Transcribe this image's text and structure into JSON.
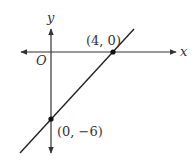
{
  "diagram": {
    "type": "coordinate-plane-line",
    "axes": {
      "x_label": "x",
      "y_label": "y",
      "origin_label": "O"
    },
    "points": [
      {
        "label": "(4, 0)",
        "x": 4,
        "y": 0
      },
      {
        "label": "(0, −6)",
        "x": 0,
        "y": -6
      }
    ],
    "line": {
      "through": [
        "(4, 0)",
        "(0, −6)"
      ]
    },
    "colors": {
      "stroke": "#333333",
      "background": "#ffffff"
    }
  }
}
